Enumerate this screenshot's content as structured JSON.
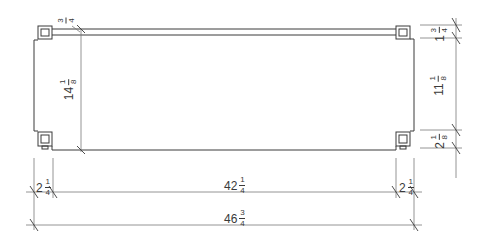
{
  "drawing": {
    "type": "elevation dimension drawing",
    "line_color": "#3a3a3a",
    "background": "#ffffff"
  },
  "dimensions": {
    "top_rail_thickness": {
      "whole": "",
      "num": "3",
      "den": "4"
    },
    "left_height": {
      "whole": "14",
      "num": "1",
      "den": "8"
    },
    "right_top": {
      "whole": "1",
      "num": "3",
      "den": "4"
    },
    "right_middle": {
      "whole": "11",
      "num": "1",
      "den": "8"
    },
    "right_bottom": {
      "whole": "2",
      "num": "1",
      "den": "8"
    },
    "bottom_left_post": {
      "whole": "2",
      "num": "1",
      "den": "4"
    },
    "bottom_middle": {
      "whole": "42",
      "num": "1",
      "den": "4"
    },
    "bottom_right_post": {
      "whole": "2",
      "num": "1",
      "den": "4"
    },
    "overall_width": {
      "whole": "46",
      "num": "3",
      "den": "4"
    }
  }
}
